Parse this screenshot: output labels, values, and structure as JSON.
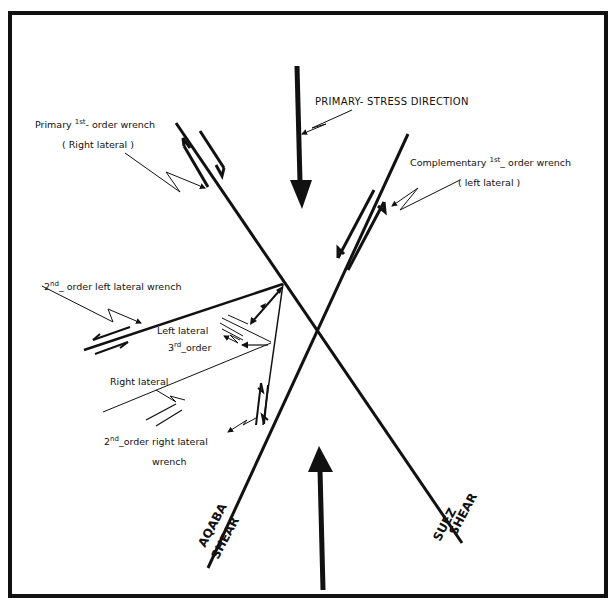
{
  "diagram": {
    "type": "wrench-fault shear model",
    "colors": {
      "ink": "#111111",
      "background": "#ffffff"
    },
    "labels": {
      "primary_stress": "PRIMARY- STRESS DIRECTION",
      "primary_wrench_prefix": "Primary ",
      "primary_wrench_sup": "st",
      "primary_wrench_num": "1",
      "primary_wrench_suffix": "- order wrench",
      "primary_wrench_sense": "( Right  lateral )",
      "complementary_wrench_prefix": "Complementary ",
      "complementary_wrench_num": "1",
      "complementary_wrench_sup": "st",
      "complementary_wrench_suffix": "_ order wrench",
      "complementary_wrench_sense": "( left  lateral )",
      "second_left_num": "2",
      "second_left_sup": "nd",
      "second_left_suffix": "_ order  left  lateral wrench",
      "left_lateral": "Left  lateral",
      "third_order_num": "3",
      "third_order_sup": "rd",
      "third_order_suffix": "_order",
      "right_lateral": "Right  lateral",
      "second_right_num": "2",
      "second_right_sup": "nd",
      "second_right_suffix": "_order  right  lateral",
      "second_right_line2": "wrench",
      "aqaba_line1": "AQABA",
      "aqaba_line2": "SHEAR",
      "suez_line1": "SUEZ",
      "suez_line2": "SHEAR"
    },
    "elements": [
      "frame",
      "suez-shear-fault",
      "aqaba-shear-fault",
      "primary-stress-arrow-top",
      "primary-stress-arrow-bottom",
      "second-order-left-lateral-fault",
      "second-order-right-lateral-fault",
      "third-order-faults"
    ]
  }
}
